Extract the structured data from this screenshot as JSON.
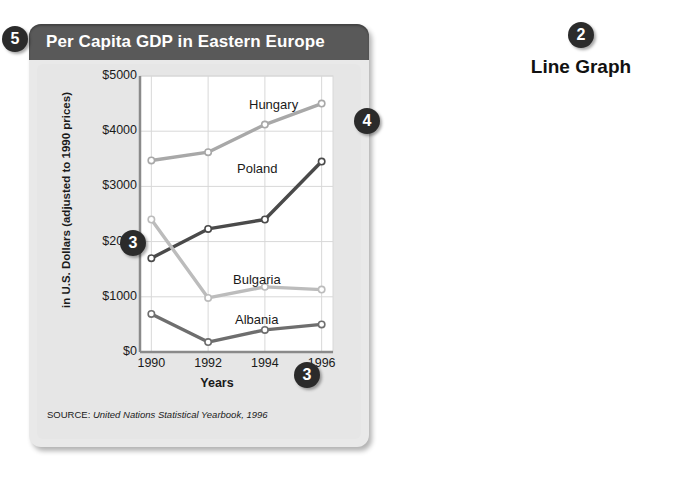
{
  "figure": {
    "title": "Per Capita GDP in Eastern Europe",
    "source_label": "SOURCE:",
    "source_text": "United Nations Statistical Yearbook, 1996"
  },
  "annotation": {
    "line_graph_label": "Line Graph",
    "callouts": [
      {
        "id": "callout-5",
        "number": "5",
        "x": 2,
        "y": 26
      },
      {
        "id": "callout-2",
        "number": "2",
        "x": 568,
        "y": 22
      },
      {
        "id": "callout-4",
        "number": "4",
        "x": 354,
        "y": 108
      },
      {
        "id": "callout-3-axis",
        "number": "3",
        "x": 120,
        "y": 230
      },
      {
        "id": "callout-3-x",
        "number": "3",
        "x": 294,
        "y": 362
      }
    ]
  },
  "colors": {
    "header_bar": "#595959",
    "card_body": "#e6e6e6",
    "hungary": "#a8a8a8",
    "poland": "#4a4a4a",
    "bulgaria": "#bcbcbc",
    "albania": "#6e6e6e",
    "grid": "#d8d8d8",
    "axis": "#8a8a8a"
  },
  "chart_data": {
    "type": "line",
    "title": "Per Capita GDP in Eastern Europe",
    "xlabel": "Years",
    "ylabel": "in U.S. Dollars (adjusted to 1990 prices)",
    "x": [
      1990,
      1992,
      1994,
      1996
    ],
    "xticklabels": [
      "1990",
      "1992",
      "1994",
      "1996"
    ],
    "yticklabels": [
      "$0",
      "$1000",
      "$2000",
      "$3000",
      "$4000",
      "$5000"
    ],
    "yticks": [
      0,
      1000,
      2000,
      3000,
      4000,
      5000
    ],
    "ylim": [
      0,
      5000
    ],
    "xlim": [
      1989.6,
      1996.4
    ],
    "grid": true,
    "legend": "inline-labels",
    "series": [
      {
        "name": "Hungary",
        "color": "#a8a8a8",
        "values": [
          3470,
          3620,
          4120,
          4500
        ]
      },
      {
        "name": "Poland",
        "color": "#4a4a4a",
        "values": [
          1700,
          2230,
          2400,
          3450
        ]
      },
      {
        "name": "Bulgaria",
        "color": "#bcbcbc",
        "values": [
          2400,
          980,
          1180,
          1130
        ]
      },
      {
        "name": "Albania",
        "color": "#6e6e6e",
        "values": [
          690,
          180,
          400,
          500
        ]
      }
    ],
    "series_label_positions": [
      {
        "name": "Hungary",
        "x": 212,
        "y": 33
      },
      {
        "name": "Poland",
        "x": 200,
        "y": 97
      },
      {
        "name": "Bulgaria",
        "x": 196,
        "y": 208
      },
      {
        "name": "Albania",
        "x": 198,
        "y": 248
      }
    ]
  }
}
